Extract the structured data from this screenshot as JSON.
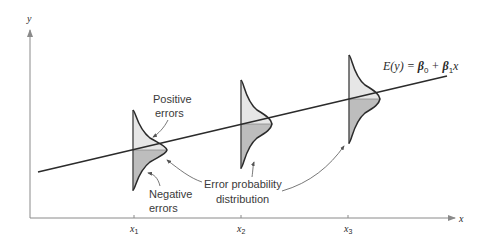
{
  "diagram": {
    "axes": {
      "y_label": "y",
      "x_label": "x",
      "tick_labels": [
        {
          "base": "x",
          "sub": "1"
        },
        {
          "base": "x",
          "sub": "2"
        },
        {
          "base": "x",
          "sub": "3"
        }
      ]
    },
    "equation": {
      "lhs": "E(y) = ",
      "b0": "β",
      "b0_sub": "0",
      "plus": " + ",
      "b1": "β",
      "b1_sub": "1",
      "var": "x"
    },
    "annotations": {
      "positive_line1": "Positive",
      "positive_line2": "errors",
      "negative_line1": "Negative",
      "negative_line2": "errors",
      "error_dist_line1": "Error probability",
      "error_dist_line2": "distribution"
    },
    "colors": {
      "line": "#2b2b2b",
      "axis": "#8a8a8a",
      "upper_fill": "#e6e6e6",
      "lower_fill": "#bdbdbd",
      "curve": "#2b2b2b"
    }
  }
}
